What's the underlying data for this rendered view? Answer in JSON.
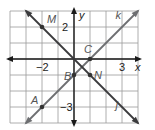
{
  "diagram": {
    "x_range": [
      -4,
      4
    ],
    "y_range": [
      -4,
      3
    ],
    "axis_labels": {
      "x": "x",
      "y": "y"
    },
    "tick_labels": [
      {
        "text": "2",
        "x": 0,
        "y": 2,
        "axis": "y"
      },
      {
        "text": "−3",
        "x": 0,
        "y": -3,
        "axis": "y"
      },
      {
        "text": "−2",
        "x": -2,
        "y": 0,
        "axis": "x"
      },
      {
        "text": "3",
        "x": 3,
        "y": 0,
        "axis": "x"
      }
    ],
    "points": [
      {
        "name": "M",
        "x": -2,
        "y": 2
      },
      {
        "name": "A",
        "x": -2,
        "y": -3
      },
      {
        "name": "B",
        "x": 0,
        "y": -1
      },
      {
        "name": "C",
        "x": 1,
        "y": 0
      },
      {
        "name": "N",
        "x": 1,
        "y": -1
      }
    ],
    "lines": [
      {
        "name": "k",
        "slope": 1,
        "intercept": -1,
        "color": "#6d6e71"
      },
      {
        "name": "j",
        "slope": -1,
        "intercept": 0,
        "color": "#3a3a3c"
      }
    ],
    "colors": {
      "grid": "#9b9b9b",
      "axis": "#1a1a1a"
    }
  }
}
